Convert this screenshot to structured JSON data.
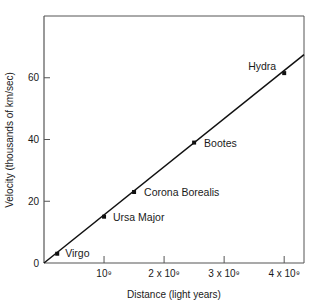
{
  "chart_data": {
    "type": "line",
    "title": "",
    "xlabel": "Distance (light years)",
    "ylabel": "Velocity (thousands of km/sec)",
    "xlim": [
      0,
      4330000000.0
    ],
    "ylim": [
      0,
      80
    ],
    "grid": false,
    "legend": null,
    "x_ticks": [
      {
        "value": 1000000000.0,
        "label": "10⁹"
      },
      {
        "value": 2000000000.0,
        "label": "2 x 10⁹"
      },
      {
        "value": 3000000000.0,
        "label": "3 x 10⁹"
      },
      {
        "value": 4000000000.0,
        "label": "4 x 10⁹"
      }
    ],
    "y_ticks": [
      {
        "value": 0,
        "label": "0"
      },
      {
        "value": 20,
        "label": "20"
      },
      {
        "value": 40,
        "label": "40"
      },
      {
        "value": 60,
        "label": "60"
      }
    ],
    "series": [
      {
        "name": "Galaxies",
        "points": [
          {
            "label": "Virgo",
            "x": 220000000.0,
            "y": 3
          },
          {
            "label": "Ursa Major",
            "x": 1000000000.0,
            "y": 15
          },
          {
            "label": "Corona Borealis",
            "x": 1500000000.0,
            "y": 23
          },
          {
            "label": "Bootes",
            "x": 2500000000.0,
            "y": 39
          },
          {
            "label": "Hydra",
            "x": 4000000000.0,
            "y": 61.5
          }
        ]
      }
    ],
    "fit_line": {
      "x0": 0,
      "y0": 0,
      "x1": 4330000000.0,
      "y1": 67.5
    },
    "colors": {
      "line": "#111111",
      "axis": "#555555",
      "text": "#1a1a1a"
    }
  }
}
